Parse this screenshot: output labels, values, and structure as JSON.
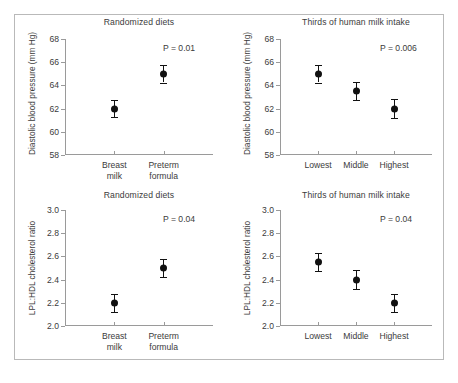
{
  "figure": {
    "panels": [
      {
        "id": "diastolic-randomized",
        "title": "Randomized diets",
        "pvalue": "P = 0.01",
        "ylabel": "Diastolic blood pressure (mm Hg)"
      },
      {
        "id": "diastolic-thirds",
        "title": "Thirds of human milk intake",
        "pvalue": "P = 0.006",
        "ylabel": "Diastolic blood pressure (mm Hg)"
      },
      {
        "id": "ratio-randomized",
        "title": "Randomized diets",
        "pvalue": "P = 0.04",
        "ylabel": "LPL:HDL cholesterol ratio"
      },
      {
        "id": "ratio-thirds",
        "title": "Thirds of human milk intake",
        "pvalue": "P = 0.04",
        "ylabel": "LPL:HDL cholesterol ratio"
      }
    ]
  },
  "chart_data": [
    {
      "type": "scatter",
      "id": "diastolic-randomized",
      "title": "Randomized diets",
      "xlabel": "",
      "ylabel": "Diastolic blood pressure (mm Hg)",
      "ylim": [
        58,
        68
      ],
      "yticks": [
        58,
        60,
        62,
        64,
        66,
        68
      ],
      "ytick_labels": [
        "58",
        "60",
        "62",
        "64",
        "66",
        "68"
      ],
      "categories": [
        "Breast milk",
        "Preterm formula"
      ],
      "category_lines": [
        [
          "Breast",
          "milk"
        ],
        [
          "Preterm",
          "formula"
        ]
      ],
      "values": [
        62.0,
        65.0
      ],
      "errors": [
        0.7,
        0.75
      ],
      "annotations": [
        "P = 0.01"
      ],
      "grid": false,
      "legend": "none"
    },
    {
      "type": "scatter",
      "id": "diastolic-thirds",
      "title": "Thirds of human milk intake",
      "xlabel": "",
      "ylabel": "Diastolic blood pressure (mm Hg)",
      "ylim": [
        58,
        68
      ],
      "yticks": [
        58,
        60,
        62,
        64,
        66,
        68
      ],
      "ytick_labels": [
        "58",
        "60",
        "62",
        "64",
        "66",
        "68"
      ],
      "categories": [
        "Lowest",
        "Middle",
        "Highest"
      ],
      "category_lines": [
        [
          "Lowest"
        ],
        [
          "Middle"
        ],
        [
          "Highest"
        ]
      ],
      "values": [
        65.0,
        63.5,
        62.0
      ],
      "errors": [
        0.75,
        0.8,
        0.8
      ],
      "annotations": [
        "P = 0.006"
      ],
      "grid": false,
      "legend": "none"
    },
    {
      "type": "scatter",
      "id": "ratio-randomized",
      "title": "Randomized diets",
      "xlabel": "",
      "ylabel": "LPL:HDL cholesterol ratio",
      "ylim": [
        2.0,
        3.0
      ],
      "yticks": [
        2.0,
        2.2,
        2.4,
        2.6,
        2.8,
        3.0
      ],
      "ytick_labels": [
        "2.0",
        "2.2",
        "2.4",
        "2.6",
        "2.8",
        "3.0"
      ],
      "categories": [
        "Breast milk",
        "Preterm formula"
      ],
      "category_lines": [
        [
          "Breast",
          "milk"
        ],
        [
          "Preterm",
          "formula"
        ]
      ],
      "values": [
        2.2,
        2.5
      ],
      "errors": [
        0.08,
        0.08
      ],
      "annotations": [
        "P = 0.04"
      ],
      "grid": false,
      "legend": "none"
    },
    {
      "type": "scatter",
      "id": "ratio-thirds",
      "title": "Thirds of human milk intake",
      "xlabel": "",
      "ylabel": "LPL:HDL cholesterol ratio",
      "ylim": [
        2.0,
        3.0
      ],
      "yticks": [
        2.0,
        2.2,
        2.4,
        2.6,
        2.8,
        3.0
      ],
      "ytick_labels": [
        "2.0",
        "2.2",
        "2.4",
        "2.6",
        "2.8",
        "3.0"
      ],
      "categories": [
        "Lowest",
        "Middle",
        "Highest"
      ],
      "category_lines": [
        [
          "Lowest"
        ],
        [
          "Middle"
        ],
        [
          "Highest"
        ]
      ],
      "values": [
        2.55,
        2.4,
        2.2
      ],
      "errors": [
        0.08,
        0.08,
        0.08
      ],
      "annotations": [
        "P = 0.04"
      ],
      "grid": false,
      "legend": "none"
    }
  ]
}
